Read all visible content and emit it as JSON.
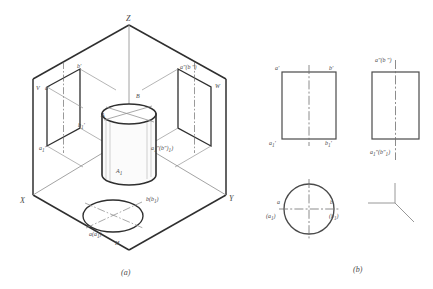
{
  "figure": {
    "title_a": "(a)",
    "title_b": "(b)",
    "caption_a_name": "pictorial-three-plane-projection",
    "caption_b_name": "three-orthographic-views"
  },
  "pictorial": {
    "axes": {
      "z": "Z",
      "x": "X",
      "y": "Y"
    },
    "planes": {
      "frontal": "V",
      "profile": "W",
      "horizontal": "H"
    },
    "solid_labels": {
      "top_left": "A",
      "top_right": "B",
      "bottom_left": "A",
      "bottom_left_sub": "1"
    },
    "v_plane_labels": {
      "top_left": "a'",
      "top_right": "b'",
      "mid_right": "b",
      "mid_right_sub": "1",
      "mid_right_prime": "'",
      "bottom_left": "a",
      "bottom_left_sub": "1",
      "bottom_left_prime": "'"
    },
    "w_plane_labels": {
      "top": "a″(b ″)",
      "bottom_base": "a",
      "bottom_sub": "1",
      "bottom_rest": "″(b″)",
      "bottom_inner_sub": "1"
    },
    "h_plane_labels": {
      "right": "b(b",
      "right_sub": "1",
      "right_close": ")",
      "left": "a(a",
      "left_sub": "1",
      "left_close": ")"
    }
  },
  "views": {
    "front_view": {
      "name": "front-view",
      "top_left": "a'",
      "top_right": "b'",
      "bottom_left_base": "a",
      "bottom_left_sub": "1",
      "bottom_left_prime": "'",
      "bottom_right_base": "b",
      "bottom_right_sub": "1",
      "bottom_right_prime": "'"
    },
    "side_view": {
      "name": "side-view",
      "top": "a″(b ″)",
      "bottom_base": "a",
      "bottom_sub": "1",
      "bottom_mid": "″(b″",
      "bottom_inner_sub": "1",
      "bottom_close": ")"
    },
    "top_view": {
      "name": "top-view",
      "left_upper": "a",
      "left_lower_open": "(a",
      "left_lower_sub": "1",
      "left_lower_close": ")",
      "right_upper": "b",
      "right_lower_open": "(b",
      "right_lower_sub": "1",
      "right_lower_close": ")"
    },
    "axis_symbol": {
      "name": "projection-axis-origin"
    }
  },
  "colors": {
    "line": "#4a4a4a",
    "heavy_line": "#2f2f2f",
    "thin_line": "#8c8c8c",
    "center_line": "#6e6e6e",
    "background": "#ffffff"
  }
}
